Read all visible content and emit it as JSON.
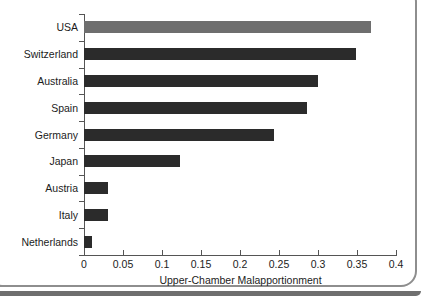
{
  "chart_data": {
    "type": "bar",
    "orientation": "horizontal",
    "title": "",
    "xlabel": "Upper-Chamber Malapportionment",
    "ylabel": "",
    "categories": [
      "USA",
      "Switzerland",
      "Australia",
      "Spain",
      "Germany",
      "Japan",
      "Austria",
      "Italy",
      "Netherlands"
    ],
    "values": [
      0.368,
      0.349,
      0.3,
      0.286,
      0.244,
      0.123,
      0.031,
      0.031,
      0.01
    ],
    "xlim": [
      0,
      0.4
    ],
    "xticks": [
      0,
      0.05,
      0.1,
      0.15,
      0.2,
      0.25,
      0.3,
      0.35,
      0.4
    ],
    "xtick_labels": [
      "0",
      "0.05",
      "0.1",
      "0.15",
      "0.2",
      "0.25",
      "0.3",
      "0.35",
      "0.4"
    ],
    "grid": false,
    "legend": "none",
    "bar_colors": [
      "#6e6e6e",
      "#2b2b2b",
      "#2b2b2b",
      "#2b2b2b",
      "#2b2b2b",
      "#2b2b2b",
      "#2b2b2b",
      "#2b2b2b",
      "#2b2b2b"
    ],
    "highlight_category": "USA",
    "colors": {
      "highlight_bar": "#6e6e6e",
      "bar": "#2b2b2b",
      "axis": "#555555",
      "text": "#1c1c1c",
      "background": "#ffffff",
      "page_border": "#8e8e8e"
    }
  }
}
